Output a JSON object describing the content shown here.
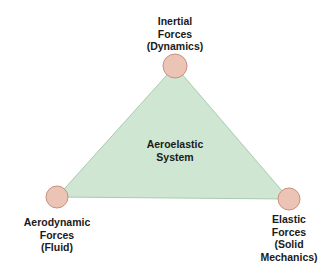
{
  "diagram": {
    "center_label": [
      "Aeroelastic",
      "System"
    ],
    "colors": {
      "triangle_fill": "#cfe6d2",
      "triangle_stroke": "#a9cbb0",
      "node_fill": "#ecc4b6",
      "node_stroke": "#c98f7f",
      "text": "#1a1a1a"
    },
    "nodes": [
      {
        "id": "inertial",
        "lines": [
          "Inertial",
          "Forces",
          "(Dynamics)"
        ]
      },
      {
        "id": "aerodynamic",
        "lines": [
          "Aerodynamic",
          "Forces",
          "(Fluid)"
        ]
      },
      {
        "id": "elastic",
        "lines": [
          "Elastic",
          "Forces",
          "(Solid",
          "Mechanics)"
        ]
      }
    ]
  }
}
